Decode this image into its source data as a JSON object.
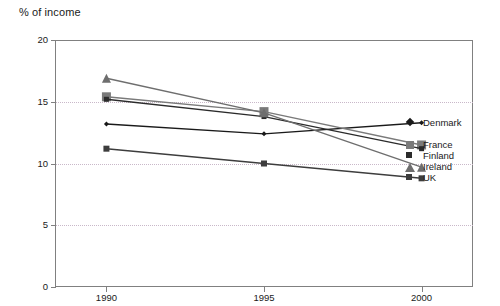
{
  "chart_data": {
    "type": "line",
    "title": "% of income",
    "xlabel": "",
    "ylabel": "% of income",
    "x": [
      1990,
      1995,
      2000
    ],
    "xtick_labels": [
      "1990",
      "1995",
      "2000"
    ],
    "ytick_labels": [
      "0",
      "5",
      "10",
      "15",
      "20"
    ],
    "yticks": [
      0,
      5,
      10,
      15,
      20
    ],
    "ylim": [
      0,
      20
    ],
    "xlim": [
      1988.4,
      2001.6
    ],
    "grid": "horizontal-dotted",
    "legend_position": "right-inside-plot",
    "series": [
      {
        "name": "Denmark",
        "values": [
          13.2,
          12.4,
          13.3
        ],
        "color": "#1a1a1a",
        "marker": "diamond",
        "marker_size": 5
      },
      {
        "name": "France",
        "values": [
          15.4,
          14.2,
          11.5
        ],
        "color": "#7a7a7a",
        "marker": "square",
        "marker_size": 9
      },
      {
        "name": "Finland",
        "values": [
          15.2,
          13.8,
          11.2
        ],
        "color": "#2b2b2b",
        "marker": "square",
        "marker_size": 5
      },
      {
        "name": "Ireland",
        "values": [
          16.9,
          14.1,
          9.7
        ],
        "color": "#6e6e6e",
        "marker": "triangle",
        "marker_size": 9
      },
      {
        "name": "UK",
        "values": [
          11.2,
          10.0,
          8.8
        ],
        "color": "#3d3d3d",
        "marker": "square",
        "marker_size": 6
      }
    ]
  },
  "legend": {
    "items": [
      {
        "label": "Denmark"
      },
      {
        "label": "France"
      },
      {
        "label": "Finland"
      },
      {
        "label": "Ireland"
      },
      {
        "label": "UK"
      }
    ]
  },
  "colors": {
    "frame": "#808080",
    "grid": "#c9b8c9",
    "text": "#1a1a1a",
    "background": "#ffffff"
  }
}
